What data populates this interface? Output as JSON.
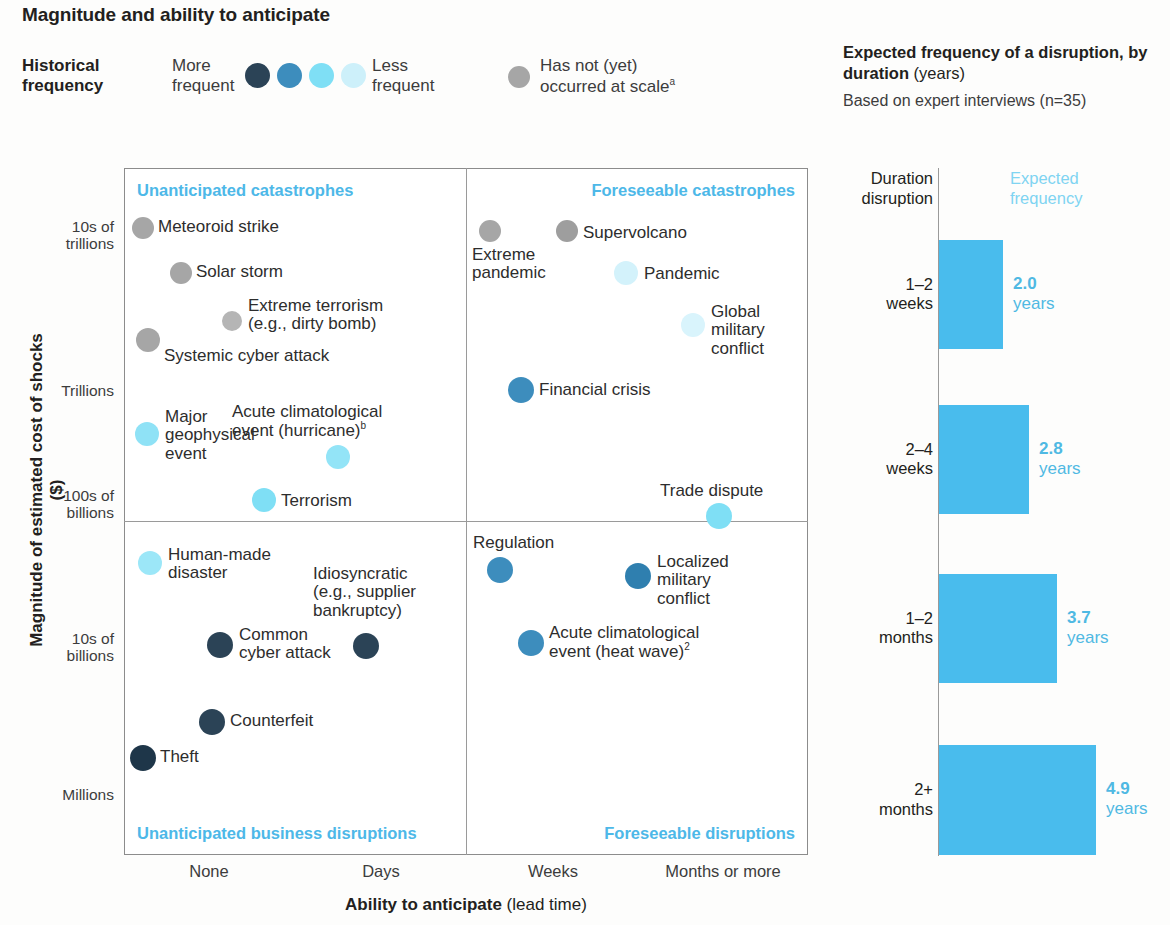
{
  "title": "Magnitude and ability to anticipate",
  "legend": {
    "title_line1": "Historical",
    "title_line2": "frequency",
    "more_line1": "More",
    "more_line2": "frequent",
    "less_line1": "Less",
    "less_line2": "frequent",
    "not_yet_line1": "Has not (yet)",
    "not_yet_line2": "occurred at scale",
    "not_yet_sup": "a",
    "swatch_colors": [
      "#2b4356",
      "#3d8dbd",
      "#7fdff5",
      "#cdf0fa"
    ],
    "not_yet_color": "#a6a6a6"
  },
  "right_panel": {
    "title_bold": "Expected frequency of a disruption, by duration",
    "title_norm": " (years)",
    "subtitle": "Based on expert interviews (n=35)",
    "col_head_left_l1": "Duration",
    "col_head_left_l2": "disruption",
    "col_head_right_l1": "Expected",
    "col_head_right_l2": "frequency",
    "accent": "#49bced"
  },
  "scatter": {
    "ylabel": "Magnitude of estimated cost of shocks ($)",
    "xlabel_bold": "Ability to anticipate",
    "xlabel_norm": " (lead time)",
    "yticks": [
      "10s of\ntrillions",
      "Trillions",
      "100s of\nbillions",
      "10s of\nbillions",
      "Millions"
    ],
    "ytick_1a": "10s of",
    "ytick_1b": "trillions",
    "ytick_2": "Trillions",
    "ytick_3a": "100s of",
    "ytick_3b": "billions",
    "ytick_4a": "10s of",
    "ytick_4b": "billions",
    "ytick_5": "Millions",
    "xticks": [
      "None",
      "Days",
      "Weeks",
      "Months or more"
    ],
    "quadrants": {
      "top_left": "Unanticipated catastrophes",
      "top_right": "Foreseeable catastrophes",
      "bottom_left": "Unanticipated business disruptions",
      "bottom_right": "Foreseeable disruptions"
    }
  },
  "chart_data": [
    {
      "type": "scatter",
      "title": "Magnitude and ability to anticipate",
      "xlabel": "Ability to anticipate (lead time)",
      "ylabel": "Magnitude of estimated cost of shocks ($)",
      "xticks": [
        "None",
        "Days",
        "Weeks",
        "Months or more"
      ],
      "yticks": [
        "Millions",
        "10s of billions",
        "100s of billions",
        "Trillions",
        "10s of trillions"
      ],
      "grid": false,
      "legend": "Historical frequency: More frequent (dark) to Less frequent (pale); grey = has not (yet) occurred at scale",
      "color_key": {
        "most_frequent": "#2b4356",
        "frequent": "#3d8dbd",
        "less_frequent": "#7fdff5",
        "least_frequent": "#cdf0fa",
        "not_occurred": "#a6a6a6"
      },
      "points": [
        {
          "label": "Meteoroid strike",
          "frequency": "not_occurred",
          "color": "#a6a6a6",
          "x_px": 143,
          "y_px": 228,
          "r": 11,
          "lx": 158,
          "ly": 218,
          "lines": [
            "Meteoroid strike"
          ]
        },
        {
          "label": "Solar storm",
          "frequency": "not_occurred",
          "color": "#a6a6a6",
          "x_px": 181,
          "y_px": 273,
          "r": 11,
          "lx": 196,
          "ly": 263,
          "lines": [
            "Solar storm"
          ]
        },
        {
          "label": "Extreme terrorism (e.g., dirty bomb)",
          "frequency": "not_occurred",
          "color": "#b5b5b5",
          "x_px": 232,
          "y_px": 321,
          "r": 10,
          "lx": 248,
          "ly": 297,
          "lines": [
            "Extreme terrorism",
            "(e.g., dirty bomb)"
          ]
        },
        {
          "label": "Systemic cyber attack",
          "frequency": "not_occurred",
          "color": "#a6a6a6",
          "x_px": 148,
          "y_px": 340,
          "r": 12,
          "lx": 164,
          "ly": 347,
          "lines": [
            "Systemic cyber attack"
          ]
        },
        {
          "label": "Major geophysical event",
          "frequency": "less_frequent",
          "color": "#8fe2f6",
          "x_px": 147,
          "y_px": 434,
          "r": 12,
          "lx": 165,
          "ly": 408,
          "lines": [
            "Major",
            "geophysical",
            "event"
          ]
        },
        {
          "label": "Acute climatological event (hurricane)",
          "sup": "b",
          "frequency": "less_frequent",
          "color": "#93e4f7",
          "x_px": 338,
          "y_px": 457,
          "r": 12,
          "lx": 232,
          "ly": 403,
          "lines": [
            "Acute climatological",
            "event (hurricane)"
          ]
        },
        {
          "label": "Terrorism",
          "frequency": "less_frequent",
          "color": "#7fdff5",
          "x_px": 264,
          "y_px": 500,
          "r": 12,
          "lx": 281,
          "ly": 492,
          "lines": [
            "Terrorism"
          ]
        },
        {
          "label": "Human-made disaster",
          "frequency": "less_frequent",
          "color": "#9ce7f8",
          "x_px": 150,
          "y_px": 563,
          "r": 12,
          "lx": 168,
          "ly": 546,
          "lines": [
            "Human-made",
            "disaster"
          ]
        },
        {
          "label": "Idiosyncratic (e.g., supplier bankruptcy)",
          "frequency": "most_frequent",
          "color": "#2b4356",
          "x_px": 366,
          "y_px": 646,
          "r": 13,
          "lx": 313,
          "ly": 565,
          "lines": [
            "Idiosyncratic",
            "(e.g., supplier",
            "bankruptcy)"
          ]
        },
        {
          "label": "Common cyber attack",
          "frequency": "most_frequent",
          "color": "#2b4356",
          "x_px": 220,
          "y_px": 645,
          "r": 13,
          "lx": 239,
          "ly": 626,
          "lines": [
            "Common",
            "cyber attack"
          ]
        },
        {
          "label": "Counterfeit",
          "frequency": "most_frequent",
          "color": "#2b4356",
          "x_px": 212,
          "y_px": 722,
          "r": 13,
          "lx": 230,
          "ly": 712,
          "lines": [
            "Counterfeit"
          ]
        },
        {
          "label": "Theft",
          "frequency": "most_frequent",
          "color": "#1e3649",
          "x_px": 143,
          "y_px": 758,
          "r": 13,
          "lx": 160,
          "ly": 748,
          "lines": [
            "Theft"
          ]
        },
        {
          "label": "Extreme pandemic",
          "frequency": "not_occurred",
          "color": "#a6a6a6",
          "x_px": 490,
          "y_px": 231,
          "r": 11,
          "lx": 472,
          "ly": 246,
          "lines": [
            "Extreme",
            "pandemic"
          ]
        },
        {
          "label": "Supervolcano",
          "frequency": "not_occurred",
          "color": "#9e9e9e",
          "x_px": 567,
          "y_px": 231,
          "r": 11,
          "lx": 583,
          "ly": 224,
          "lines": [
            "Supervolcano"
          ]
        },
        {
          "label": "Pandemic",
          "frequency": "least_frequent",
          "color": "#d3f2fb",
          "x_px": 626,
          "y_px": 273,
          "r": 12,
          "lx": 644,
          "ly": 265,
          "lines": [
            "Pandemic"
          ]
        },
        {
          "label": "Global military conflict",
          "frequency": "least_frequent",
          "color": "#d9f4fc",
          "x_px": 693,
          "y_px": 325,
          "r": 12,
          "lx": 711,
          "ly": 303,
          "lines": [
            "Global",
            "military",
            "conflict"
          ]
        },
        {
          "label": "Financial crisis",
          "frequency": "frequent",
          "color": "#3d8dbd",
          "x_px": 521,
          "y_px": 390,
          "r": 13,
          "lx": 539,
          "ly": 381,
          "lines": [
            "Financial crisis"
          ]
        },
        {
          "label": "Trade dispute",
          "frequency": "less_frequent",
          "color": "#7fdff5",
          "x_px": 719,
          "y_px": 516,
          "r": 13,
          "lx": 660,
          "ly": 482,
          "lines": [
            "Trade dispute"
          ]
        },
        {
          "label": "Regulation",
          "frequency": "frequent",
          "color": "#3d8dbd",
          "x_px": 500,
          "y_px": 570,
          "r": 13,
          "lx": 473,
          "ly": 534,
          "lines": [
            "Regulation"
          ]
        },
        {
          "label": "Localized military conflict",
          "frequency": "frequent",
          "color": "#2f7faf",
          "x_px": 638,
          "y_px": 576,
          "r": 13,
          "lx": 657,
          "ly": 553,
          "lines": [
            "Localized",
            "military",
            "conflict"
          ]
        },
        {
          "label": "Acute climatological event (heat wave)",
          "sup": "2",
          "frequency": "frequent",
          "color": "#3d8dbd",
          "x_px": 531,
          "y_px": 643,
          "r": 13,
          "lx": 549,
          "ly": 624,
          "lines": [
            "Acute climatological",
            "event (heat wave)"
          ]
        }
      ]
    },
    {
      "type": "bar",
      "orientation": "horizontal",
      "title": "Expected frequency of a disruption, by duration (years)",
      "subtitle": "Based on expert interviews (n=35)",
      "categories": [
        "1–2 weeks",
        "2–4 weeks",
        "1–2 months",
        "2+ months"
      ],
      "values": [
        2.0,
        2.8,
        3.7,
        4.9
      ],
      "value_labels": [
        "2.0",
        "2.8",
        "3.7",
        "4.9"
      ],
      "unit": "years",
      "xlabel": "",
      "ylabel": "Duration disruption",
      "xlim": [
        0,
        5.2
      ],
      "grid": false,
      "color": "#49bced"
    }
  ],
  "bars": [
    {
      "cat_l1": "1–2",
      "cat_l2": "weeks",
      "value": "2.0",
      "unit": "years",
      "top": 240,
      "height": 109,
      "width": 64
    },
    {
      "cat_l1": "2–4",
      "cat_l2": "weeks",
      "value": "2.8",
      "unit": "years",
      "top": 405,
      "height": 109,
      "width": 90
    },
    {
      "cat_l1": "1–2",
      "cat_l2": "months",
      "value": "3.7",
      "unit": "years",
      "top": 574,
      "height": 109,
      "width": 118
    },
    {
      "cat_l1": "2+",
      "cat_l2": "months",
      "value": "4.9",
      "unit": "years",
      "top": 745,
      "height": 110,
      "width": 157
    }
  ]
}
